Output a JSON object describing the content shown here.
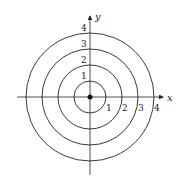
{
  "diagram": {
    "type": "polar-concentric-circles",
    "center": {
      "x": 0,
      "y": 0
    },
    "axes": {
      "x_label": "x",
      "y_label": "y"
    },
    "circles": [
      {
        "radius": 1,
        "label": "1"
      },
      {
        "radius": 2,
        "label": "2"
      },
      {
        "radius": 3,
        "label": "3"
      },
      {
        "radius": 4,
        "label": "4"
      }
    ],
    "x_axis_ticks": [
      "1",
      "2",
      "3",
      "4"
    ],
    "y_axis_ticks": [
      "1",
      "2",
      "3",
      "4"
    ],
    "origin_point": true,
    "colors": {
      "stroke": "#222222",
      "background": "#ffffff"
    }
  }
}
